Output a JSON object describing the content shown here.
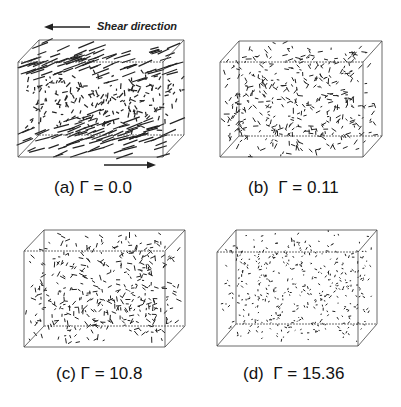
{
  "figure": {
    "shear_label": "Shear direction",
    "panels": [
      {
        "id": "a",
        "caption": "(a) Γ = 0.0",
        "gamma": 0.0,
        "box": {
          "bx": 39,
          "by": 40,
          "fx": 18,
          "fy": 62,
          "w": 145,
          "h": 95
        },
        "seg_len": 9,
        "aligned": true,
        "seed": 11,
        "n": 380
      },
      {
        "id": "b",
        "caption": "(b)  Γ = 0.11",
        "gamma": 0.11,
        "box": {
          "bx": 239,
          "by": 41,
          "fx": 220,
          "fy": 62,
          "w": 143,
          "h": 95
        },
        "seg_len": 4,
        "aligned": false,
        "seed": 23,
        "n": 420
      },
      {
        "id": "c",
        "caption": "(c) Γ = 10.8",
        "gamma": 10.8,
        "box": {
          "bx": 44,
          "by": 230,
          "fx": 24,
          "fy": 251,
          "w": 141,
          "h": 96
        },
        "seg_len": 4,
        "aligned": false,
        "seed": 37,
        "n": 400
      },
      {
        "id": "d",
        "caption": "(d)  Γ = 15.36",
        "gamma": 15.36,
        "box": {
          "bx": 236,
          "by": 230,
          "fx": 217,
          "fy": 252,
          "w": 141,
          "h": 94
        },
        "seg_len": 2,
        "aligned": false,
        "seed": 51,
        "n": 420
      }
    ]
  }
}
